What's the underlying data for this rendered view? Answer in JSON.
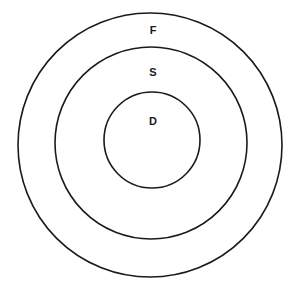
{
  "diagram": {
    "type": "concentric-circles",
    "rings": [
      {
        "id": "outer",
        "label": "F",
        "cx": 150,
        "cy": 145,
        "r": 132,
        "label_x": 153,
        "label_y": 30
      },
      {
        "id": "middle",
        "label": "S",
        "cx": 151,
        "cy": 143,
        "r": 96,
        "label_x": 153,
        "label_y": 72
      },
      {
        "id": "inner",
        "label": "D",
        "cx": 152,
        "cy": 140,
        "r": 48,
        "label_x": 153,
        "label_y": 121
      }
    ],
    "stroke_color": "#1a1a1a",
    "background": "#ffffff"
  }
}
